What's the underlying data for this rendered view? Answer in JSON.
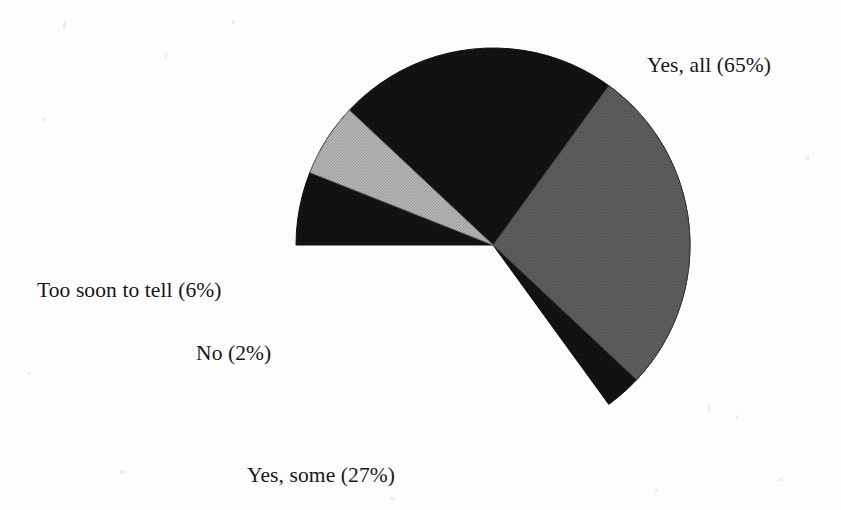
{
  "figure": {
    "background_color": "#fdfdfd",
    "text_color": "#171717"
  },
  "chart_data": {
    "type": "pie",
    "title": "",
    "subtitle": "",
    "xlabel": "",
    "ylabel": "",
    "legend_position": "none",
    "labels_position": "outside",
    "grid": false,
    "units": "percent",
    "total": 100,
    "categories": [
      "Yes, all",
      "Yes, some",
      "No",
      "Too soon to tell"
    ],
    "values": [
      65,
      27,
      2,
      6
    ],
    "colors": [
      "#111111",
      "#595959",
      "#ffffff",
      "#ababab"
    ],
    "slice_labels": [
      "Yes, all (65%)",
      "Yes, some (27%)",
      "No (2%)",
      "Too soon to tell (6%)"
    ],
    "slices": [
      {
        "name": "Yes, all",
        "value": 65,
        "label": "Yes, all (65%)",
        "color": "#111111",
        "start_angle_deg": 180,
        "sweep_deg": 234
      },
      {
        "name": "Yes, some",
        "value": 27,
        "label": "Yes, some (27%)",
        "color": "#595959",
        "start_angle_deg": 54,
        "sweep_deg": 97.2
      },
      {
        "name": "No",
        "value": 2,
        "label": "No (2%)",
        "color": "#ffffff",
        "start_angle_deg": 151.2,
        "sweep_deg": 7.2
      },
      {
        "name": "Too soon to tell",
        "value": 6,
        "label": "Too soon to tell (6%)",
        "color": "#ababab",
        "start_angle_deg": 158.4,
        "sweep_deg": 21.6
      }
    ],
    "geometry": {
      "center_x": 493,
      "center_y": 245,
      "radius": 197
    }
  },
  "labels": {
    "yes_all": "Yes, all (65%)",
    "yes_some": "Yes, some (27%)",
    "no": "No (2%)",
    "too_soon": "Too soon to tell (6%)"
  }
}
